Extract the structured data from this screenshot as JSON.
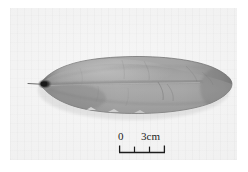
{
  "figure": {
    "kind": "grayscale-specimen-photograph",
    "orientation": "horizontal",
    "background_tone": "#f1f1f1",
    "specimen_tone": "#9c9c9c"
  },
  "scale_bar": {
    "name": "scale-bar",
    "start_label": "0",
    "end_label": "3cm",
    "unit": "cm",
    "min_value": 0,
    "max_value": 3,
    "divisions": 3,
    "tick_values": [
      0,
      1,
      2,
      3
    ]
  },
  "colors": {
    "page": "#ffffff",
    "photo_paper": "#f1f1f1",
    "specimen_light": "#b4b4b4",
    "specimen_mid": "#9c9c9c",
    "specimen_dark": "#7b7b7b",
    "specimen_shadow": "#5e5e5e",
    "tip_spot": "#2a2a2a",
    "ink": "#1d1d1d"
  }
}
